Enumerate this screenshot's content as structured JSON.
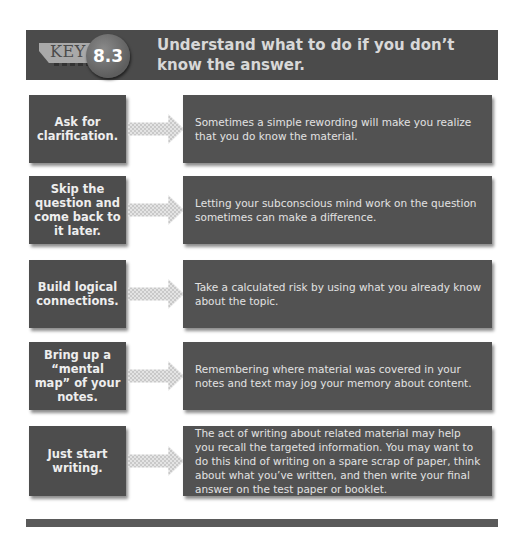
{
  "header": {
    "key_label": "KEY",
    "number": "8.3",
    "title": "Understand what to do if you don’t know the answer."
  },
  "rows": [
    {
      "strategy": "Ask for clarification.",
      "explanation": "Sometimes a simple rewording will make you realize that you do know the material."
    },
    {
      "strategy": "Skip the question and come back to it later.",
      "explanation": "Letting your subconscious mind work on the question sometimes can make a difference."
    },
    {
      "strategy": "Build logical connections.",
      "explanation": "Take a calculated risk by using what you already know about the topic."
    },
    {
      "strategy": "Bring up a “mental map” of your notes.",
      "explanation": "Remembering where material was covered in your notes and text may jog your memory about content."
    },
    {
      "strategy": "Just start writing.",
      "explanation": "The act of writing about related material may help you recall the targeted information. You may want to do this kind of writing on a spare scrap of paper, think about what you’ve written, and then write your final answer on the test paper or booklet."
    }
  ],
  "colors": {
    "header_bg": "#4b4b4b",
    "box_bg": "#525252",
    "arrow_light": "#e4e4e4",
    "text_light": "#e2e2e2"
  }
}
